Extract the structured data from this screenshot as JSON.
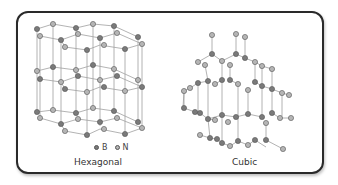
{
  "figure": {
    "panels": [
      {
        "name": "hexagonal",
        "label": "Hexagonal"
      },
      {
        "name": "cubic",
        "label": "Cubic"
      }
    ],
    "legend": [
      {
        "symbol": "B",
        "color": "#7a7a7a"
      },
      {
        "symbol": "N",
        "color": "#b5b5b5"
      }
    ],
    "colors": {
      "frame": "#2a2a2a",
      "bond": "#9a9a9a",
      "atom_B": "#7a7a7a",
      "atom_N": "#b5b5b5"
    }
  }
}
